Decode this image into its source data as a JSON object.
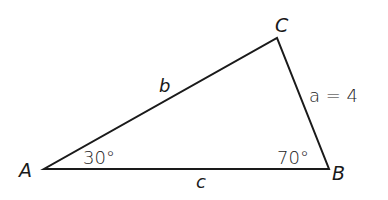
{
  "diagram": {
    "type": "triangle",
    "vertices": {
      "A": {
        "label": "A"
      },
      "B": {
        "label": "B"
      },
      "C": {
        "label": "C"
      }
    },
    "sides": {
      "a": {
        "label": "a = 4"
      },
      "b": {
        "label": "b"
      },
      "c": {
        "label": "c"
      }
    },
    "angles": {
      "A": {
        "label": "30°"
      },
      "B": {
        "label": "70°"
      }
    },
    "colors": {
      "stroke": "#1a1a1a",
      "background": "#ffffff"
    }
  }
}
